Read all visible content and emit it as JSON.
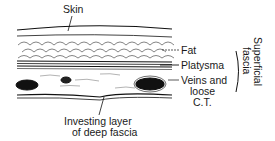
{
  "diagram": {
    "labels": {
      "skin": "Skin",
      "fat": "Fat",
      "platysma": "Platysma",
      "veins_line1": "Veins and",
      "veins_line2": "loose",
      "veins_line3": "C.T.",
      "investing_line1": "Investing layer",
      "investing_line2": "of deep fascia",
      "superficial_line1": "Superficial",
      "superficial_line2": "fascia"
    },
    "colors": {
      "ink": "#111111",
      "background": "#ffffff"
    }
  }
}
